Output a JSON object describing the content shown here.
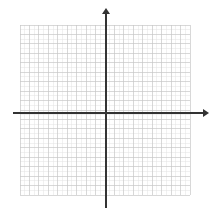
{
  "figure": {
    "title": "",
    "background_color": "#ffffff",
    "width": 212,
    "height": 220
  },
  "chart_data": {
    "type": "scatter",
    "title": "",
    "subtitle": "",
    "xlabel": "",
    "ylabel": "",
    "x": [],
    "y": [],
    "series": [],
    "annotations": [],
    "legend": {
      "entries": [],
      "position": "none"
    },
    "grid": {
      "visible": true,
      "columns": 18,
      "rows": 18,
      "cell_size_px": 9.45,
      "minor_grid": true,
      "color": "#c8c8c8",
      "minor_color": "#e4e4e4",
      "line_width": 0.7
    },
    "axes": {
      "color": "#333333",
      "line_width": 1.6,
      "x_axis": {
        "label": "",
        "visible": true,
        "arrow": "right",
        "ticks": [],
        "tick_labels": [],
        "range": [
          -9,
          9
        ]
      },
      "y_axis": {
        "label": "",
        "visible": true,
        "arrow": "up",
        "ticks": [],
        "tick_labels": [],
        "range": [
          -9,
          9
        ]
      },
      "origin": {
        "x": 0,
        "y": 0,
        "pixel_x": 106,
        "pixel_y": 113
      }
    },
    "xlim": [
      -9,
      9
    ],
    "ylim": [
      -9,
      9
    ],
    "plot_area_px": {
      "left": 20,
      "top": 25,
      "right": 190,
      "bottom": 195
    }
  },
  "colors": {
    "grid_major": "#c8c8c8",
    "grid_minor": "#e4e4e4",
    "axis": "#333333",
    "background": "#ffffff"
  }
}
